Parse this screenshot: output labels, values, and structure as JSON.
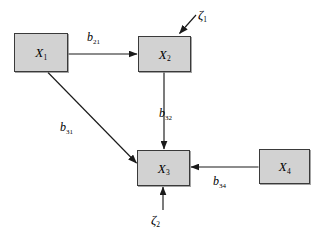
{
  "diagram": {
    "type": "path-diagram",
    "canvas": {
      "width": 319,
      "height": 239
    },
    "colors": {
      "box_fill": "#d2d2d2",
      "box_border": "#3a3a3a",
      "line": "#1a1a1a",
      "background": "#ffffff"
    },
    "nodes": [
      {
        "id": "x1",
        "name": "X",
        "subscript": "1",
        "x": 14,
        "y": 33,
        "width": 54,
        "height": 39
      },
      {
        "id": "x2",
        "name": "X",
        "subscript": "2",
        "x": 138,
        "y": 36,
        "width": 53,
        "height": 36
      },
      {
        "id": "x3",
        "name": "X",
        "subscript": "3",
        "x": 137,
        "y": 150,
        "width": 53,
        "height": 36
      },
      {
        "id": "x4",
        "name": "X",
        "subscript": "4",
        "x": 259,
        "y": 149,
        "width": 51,
        "height": 35
      }
    ],
    "paths": [
      {
        "id": "b21",
        "coefficient": "b",
        "subscript": "21",
        "from": "x1",
        "to": "x2",
        "label_x": 87,
        "label_y": 31
      },
      {
        "id": "b32",
        "coefficient": "b",
        "subscript": "32",
        "from": "x2",
        "to": "x3",
        "label_x": 159,
        "label_y": 107
      },
      {
        "id": "b31",
        "coefficient": "b",
        "subscript": "31",
        "from": "x1",
        "to": "x3",
        "label_x": 60,
        "label_y": 121
      },
      {
        "id": "b34",
        "coefficient": "b",
        "subscript": "34",
        "from": "x4",
        "to": "x3",
        "label_x": 213,
        "label_y": 175
      }
    ],
    "disturbances": [
      {
        "id": "zeta1",
        "symbol": "ζ",
        "subscript": "1",
        "to": "x2",
        "label_x": 198,
        "label_y": 8
      },
      {
        "id": "zeta2",
        "symbol": "ζ",
        "subscript": "2",
        "to": "x3",
        "label_x": 151,
        "label_y": 213
      }
    ]
  }
}
